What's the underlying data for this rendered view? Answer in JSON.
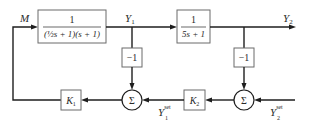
{
  "diagram": {
    "type": "block-diagram",
    "title": "",
    "signals": {
      "input": "M",
      "y1": "Y",
      "y1_sub": "1",
      "y2": "Y",
      "y2_sub": "2",
      "y1_set": "Y",
      "y1_set_sub": "1",
      "y1_set_sup": "set",
      "y2_set": "Y",
      "y2_set_sub": "2",
      "y2_set_sup": "set"
    },
    "blocks": {
      "g1": {
        "numerator": "1",
        "denominator": "(½s + 1)(s + 1)"
      },
      "g2": {
        "numerator": "1",
        "denominator": "5s + 1"
      },
      "neg1": {
        "label": "−1"
      },
      "neg2": {
        "label": "−1"
      },
      "k1": {
        "label": "K",
        "sub": "1"
      },
      "k2": {
        "label": "K",
        "sub": "2"
      }
    },
    "summing_junctions": {
      "sum1": {
        "symbol": "Σ"
      },
      "sum2": {
        "symbol": "Σ"
      }
    },
    "colors": {
      "line": "#1e1e1e",
      "box_border": "#6b6b6b",
      "text": "#2a2a2a",
      "background": "#ffffff"
    }
  }
}
